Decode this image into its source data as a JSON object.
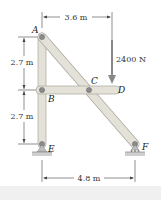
{
  "diagram": {
    "type": "frame-statics",
    "points": {
      "A": {
        "label": "A"
      },
      "B": {
        "label": "B"
      },
      "C": {
        "label": "C"
      },
      "D": {
        "label": "D"
      },
      "E": {
        "label": "E"
      },
      "F": {
        "label": "F"
      }
    },
    "dimensions": {
      "top_horizontal": "3.6 m",
      "upper_vertical": "2.7 m",
      "lower_vertical": "2.7 m",
      "bottom_horizontal": "4.8 m"
    },
    "load": {
      "value": "2400 N",
      "direction": "down",
      "applied_at": "D"
    },
    "members": [
      "AE",
      "AF",
      "BD"
    ],
    "supports": {
      "E": "pin",
      "F": "roller"
    },
    "colors": {
      "member_fill": "#e3e1d8",
      "member_stroke": "#a9a69c",
      "pin": "#8a8a8a",
      "ground": "#bdbdbd",
      "footer": "#f0f0f0"
    }
  }
}
